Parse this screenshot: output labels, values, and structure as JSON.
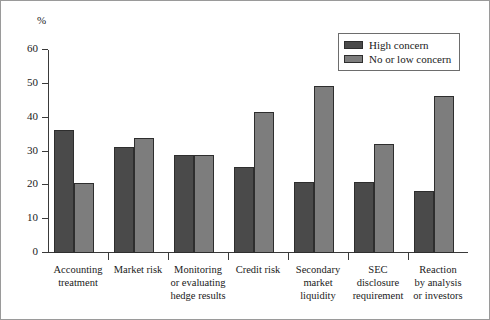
{
  "figure": {
    "unit_label": "%",
    "bar_colors": {
      "high_concern": "#4a4a4a",
      "no_or_low_concern": "#7d7d7d"
    },
    "axis_color": "#3a3a3a",
    "frame_color": "#9a9a9a"
  },
  "legend": {
    "position": "top-right",
    "entries": [
      {
        "label": "High concern",
        "color": "#4a4a4a"
      },
      {
        "label": "No or low concern",
        "color": "#7d7d7d"
      }
    ]
  },
  "chart_data": {
    "type": "bar",
    "title": "",
    "xlabel": "",
    "ylabel": "%",
    "ylim": [
      0,
      60
    ],
    "yticks": [
      0,
      10,
      20,
      30,
      40,
      50,
      60
    ],
    "ytick_labels": [
      "0",
      "10",
      "20",
      "30",
      "40",
      "50",
      "60"
    ],
    "grid": false,
    "categories": [
      "Accounting treatment",
      "Market risk",
      "Monitoring or evaluating hedge results",
      "Credit risk",
      "Secondary market liquidity",
      "SEC disclosure requirement",
      "Reaction by analysis or investors"
    ],
    "category_lines": [
      [
        "Accounting",
        "treatment"
      ],
      [
        "Market risk"
      ],
      [
        "Monitoring",
        "or evaluating",
        "hedge results"
      ],
      [
        "Credit risk"
      ],
      [
        "Secondary",
        "market",
        "liquidity"
      ],
      [
        "SEC",
        "disclosure",
        "requirement"
      ],
      [
        "Reaction",
        "by analysis",
        "or investors"
      ]
    ],
    "series": [
      {
        "name": "High concern",
        "color": "#4a4a4a",
        "values": [
          36.3,
          31.3,
          29.0,
          25.4,
          21.1,
          21.1,
          18.4
        ]
      },
      {
        "name": "No or low concern",
        "color": "#7d7d7d",
        "values": [
          20.7,
          33.9,
          29.0,
          41.7,
          49.5,
          32.1,
          46.5
        ]
      }
    ]
  }
}
